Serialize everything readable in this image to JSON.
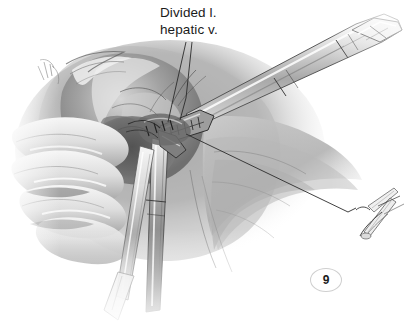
{
  "figure": {
    "number": "9",
    "alt_description": "Grayscale surgical illustration of a laparoscopic liver resection showing a gloved hand retracting the liver while a linear stapler divides the left hepatic vein",
    "background_color": "#ffffff",
    "ink_color": "#1b1b1b"
  },
  "annotations": {
    "divided_vein": {
      "line1": "Divided l.",
      "line2": "hepatic v.",
      "leader_count": 2
    }
  },
  "inset": {
    "name": "clip-applier-detail",
    "leader_label": ""
  },
  "palette": {
    "paper": "#ffffff",
    "tissue_light": "#e6e6e6",
    "tissue_mid": "#b4b4b4",
    "tissue_dark": "#7b7b7b",
    "tissue_deep": "#4f4f4f",
    "shadow": "#3a3a3a",
    "instrument_light": "#f2f2f2",
    "instrument_mid": "#c9c9c9",
    "instrument_dark": "#6e6e6e",
    "outline": "#2b2b2b",
    "leader": "#2b2b2b",
    "badge_border": "#cfcfcf"
  }
}
